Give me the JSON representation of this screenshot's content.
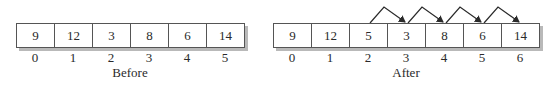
{
  "before": {
    "values": [
      "9",
      "12",
      "3",
      "8",
      "6",
      "14"
    ],
    "indices": [
      "0",
      "1",
      "2",
      "3",
      "4",
      "5"
    ],
    "caption": "Before"
  },
  "after": {
    "values": [
      "9",
      "12",
      "5",
      "3",
      "8",
      "6",
      "14"
    ],
    "indices": [
      "0",
      "1",
      "2",
      "3",
      "4",
      "5",
      "6"
    ],
    "caption": "After"
  },
  "shift_arrows": [
    {
      "from_index": 2,
      "to_index": 3
    },
    {
      "from_index": 3,
      "to_index": 4
    },
    {
      "from_index": 4,
      "to_index": 5
    },
    {
      "from_index": 5,
      "to_index": 6
    }
  ],
  "colors": {
    "line": "#555555",
    "shadow": "#b9b9b9",
    "arrow": "#2a2a2a"
  }
}
